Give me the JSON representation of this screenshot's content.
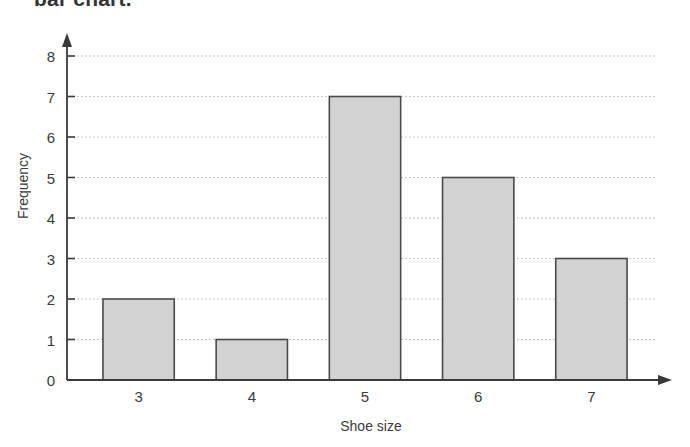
{
  "caption": {
    "text": "bar chart."
  },
  "chart_data": {
    "type": "bar",
    "title": "",
    "xlabel": "Shoe size",
    "ylabel": "Frequency",
    "categories": [
      "3",
      "4",
      "5",
      "6",
      "7"
    ],
    "values": [
      2,
      1,
      7,
      5,
      3
    ],
    "ylim": [
      0,
      8
    ],
    "yticks": [
      "0",
      "1",
      "2",
      "3",
      "4",
      "5",
      "6",
      "7",
      "8"
    ],
    "grid": "horizontal-dotted",
    "legend": "none",
    "bar_fill": "#d2d2d2",
    "bar_stroke": "#4a4a4a",
    "axis_color": "#3a3a3a",
    "grid_color": "#c8c8c8"
  }
}
